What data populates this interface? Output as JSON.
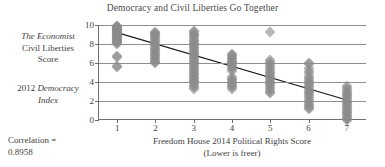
{
  "chart_data": {
    "type": "scatter",
    "title": "Democracy and Civil Liberties Go Together",
    "xlabel": "Freedom House 2014 Political Rights Score",
    "xlabel_sub": "(Lower is freer)",
    "ylabel_line1": "The Economist",
    "ylabel_line2": "Civil Liberties",
    "ylabel_line3": "Score",
    "ylabel2_line1_prefix": "2012 ",
    "ylabel2_line1_italic": "Democracy",
    "ylabel2_line2_italic": "Index",
    "correlation_label": "Correlation =",
    "correlation_value": "0.8958",
    "xlim": [
      0.5,
      7.5
    ],
    "ylim": [
      0,
      10
    ],
    "xticks": [
      1,
      2,
      3,
      4,
      5,
      6,
      7
    ],
    "yticks": [
      0,
      2,
      4,
      6,
      8,
      10
    ],
    "grid": "horizontal",
    "legend": "none",
    "marker": "diamond",
    "marker_color": "#8d8d8d",
    "trendline_color": "#1a1a1a",
    "trendline": {
      "x0": 1,
      "y0": 9.2,
      "x1": 7,
      "y1": 2.1
    },
    "points": [
      {
        "x": 1,
        "y": 9.93
      },
      {
        "x": 1,
        "y": 9.88
      },
      {
        "x": 1,
        "y": 9.8
      },
      {
        "x": 1,
        "y": 9.73
      },
      {
        "x": 1,
        "y": 9.65
      },
      {
        "x": 1,
        "y": 9.58
      },
      {
        "x": 1,
        "y": 9.5
      },
      {
        "x": 1,
        "y": 9.44
      },
      {
        "x": 1,
        "y": 9.38
      },
      {
        "x": 1,
        "y": 9.32
      },
      {
        "x": 1,
        "y": 9.26
      },
      {
        "x": 1,
        "y": 9.2
      },
      {
        "x": 1,
        "y": 9.12
      },
      {
        "x": 1,
        "y": 9.06
      },
      {
        "x": 1,
        "y": 9.0
      },
      {
        "x": 1,
        "y": 8.94
      },
      {
        "x": 1,
        "y": 8.88
      },
      {
        "x": 1,
        "y": 8.82
      },
      {
        "x": 1,
        "y": 8.76
      },
      {
        "x": 1,
        "y": 8.7
      },
      {
        "x": 1,
        "y": 8.62
      },
      {
        "x": 1,
        "y": 8.55
      },
      {
        "x": 1,
        "y": 8.48
      },
      {
        "x": 1,
        "y": 8.4
      },
      {
        "x": 1,
        "y": 8.32
      },
      {
        "x": 1,
        "y": 8.24
      },
      {
        "x": 1,
        "y": 8.16
      },
      {
        "x": 1,
        "y": 8.08
      },
      {
        "x": 1,
        "y": 8.0
      },
      {
        "x": 1,
        "y": 6.75
      },
      {
        "x": 1,
        "y": 6.65
      },
      {
        "x": 1,
        "y": 5.65
      },
      {
        "x": 1,
        "y": 5.55
      },
      {
        "x": 2,
        "y": 9.3
      },
      {
        "x": 2,
        "y": 9.2
      },
      {
        "x": 2,
        "y": 9.1
      },
      {
        "x": 2,
        "y": 8.95
      },
      {
        "x": 2,
        "y": 8.8
      },
      {
        "x": 2,
        "y": 8.65
      },
      {
        "x": 2,
        "y": 8.5
      },
      {
        "x": 2,
        "y": 8.35
      },
      {
        "x": 2,
        "y": 8.2
      },
      {
        "x": 2,
        "y": 8.05
      },
      {
        "x": 2,
        "y": 7.9
      },
      {
        "x": 2,
        "y": 7.75
      },
      {
        "x": 2,
        "y": 7.6
      },
      {
        "x": 2,
        "y": 7.45
      },
      {
        "x": 2,
        "y": 7.3
      },
      {
        "x": 2,
        "y": 7.15
      },
      {
        "x": 2,
        "y": 7.0
      },
      {
        "x": 2,
        "y": 6.85
      },
      {
        "x": 2,
        "y": 6.7
      },
      {
        "x": 2,
        "y": 6.55
      },
      {
        "x": 2,
        "y": 6.4
      },
      {
        "x": 2,
        "y": 6.25
      },
      {
        "x": 2,
        "y": 6.1
      },
      {
        "x": 2,
        "y": 6.0
      },
      {
        "x": 3,
        "y": 9.4
      },
      {
        "x": 3,
        "y": 9.25
      },
      {
        "x": 3,
        "y": 9.1
      },
      {
        "x": 3,
        "y": 8.95
      },
      {
        "x": 3,
        "y": 8.8
      },
      {
        "x": 3,
        "y": 8.62
      },
      {
        "x": 3,
        "y": 8.45
      },
      {
        "x": 3,
        "y": 8.3
      },
      {
        "x": 3,
        "y": 8.15
      },
      {
        "x": 3,
        "y": 8.0
      },
      {
        "x": 3,
        "y": 7.85
      },
      {
        "x": 3,
        "y": 7.7
      },
      {
        "x": 3,
        "y": 7.55
      },
      {
        "x": 3,
        "y": 7.4
      },
      {
        "x": 3,
        "y": 7.25
      },
      {
        "x": 3,
        "y": 7.1
      },
      {
        "x": 3,
        "y": 6.95
      },
      {
        "x": 3,
        "y": 6.8
      },
      {
        "x": 3,
        "y": 6.65
      },
      {
        "x": 3,
        "y": 6.5
      },
      {
        "x": 3,
        "y": 6.35
      },
      {
        "x": 3,
        "y": 6.2
      },
      {
        "x": 3,
        "y": 6.05
      },
      {
        "x": 3,
        "y": 5.9
      },
      {
        "x": 3,
        "y": 5.75
      },
      {
        "x": 3,
        "y": 5.6
      },
      {
        "x": 3,
        "y": 5.45
      },
      {
        "x": 3,
        "y": 5.3
      },
      {
        "x": 3,
        "y": 5.15
      },
      {
        "x": 3,
        "y": 5.0
      },
      {
        "x": 3,
        "y": 4.85
      },
      {
        "x": 3,
        "y": 4.7
      },
      {
        "x": 3,
        "y": 4.55
      },
      {
        "x": 3,
        "y": 4.4
      },
      {
        "x": 3,
        "y": 4.25
      },
      {
        "x": 3,
        "y": 4.1
      },
      {
        "x": 3,
        "y": 3.95
      },
      {
        "x": 3,
        "y": 3.8
      },
      {
        "x": 3,
        "y": 3.62
      },
      {
        "x": 3,
        "y": 3.45
      },
      {
        "x": 3,
        "y": 3.3
      },
      {
        "x": 4,
        "y": 7.0
      },
      {
        "x": 4,
        "y": 6.85
      },
      {
        "x": 4,
        "y": 6.7
      },
      {
        "x": 4,
        "y": 6.55
      },
      {
        "x": 4,
        "y": 6.4
      },
      {
        "x": 4,
        "y": 6.25
      },
      {
        "x": 4,
        "y": 6.1
      },
      {
        "x": 4,
        "y": 5.95
      },
      {
        "x": 4,
        "y": 5.8
      },
      {
        "x": 4,
        "y": 5.65
      },
      {
        "x": 4,
        "y": 5.5
      },
      {
        "x": 4,
        "y": 5.35
      },
      {
        "x": 4,
        "y": 5.2
      },
      {
        "x": 4,
        "y": 4.5
      },
      {
        "x": 4,
        "y": 4.35
      },
      {
        "x": 4,
        "y": 4.2
      },
      {
        "x": 4,
        "y": 4.05
      },
      {
        "x": 4,
        "y": 3.9
      },
      {
        "x": 4,
        "y": 3.75
      },
      {
        "x": 4,
        "y": 3.6
      },
      {
        "x": 4,
        "y": 3.45
      },
      {
        "x": 4,
        "y": 3.3
      },
      {
        "x": 5,
        "y": 9.25
      },
      {
        "x": 5,
        "y": 6.3
      },
      {
        "x": 5,
        "y": 6.1
      },
      {
        "x": 5,
        "y": 5.9
      },
      {
        "x": 5,
        "y": 5.7
      },
      {
        "x": 5,
        "y": 5.5
      },
      {
        "x": 5,
        "y": 5.3
      },
      {
        "x": 5,
        "y": 5.1
      },
      {
        "x": 5,
        "y": 4.9
      },
      {
        "x": 5,
        "y": 4.72
      },
      {
        "x": 5,
        "y": 4.55
      },
      {
        "x": 5,
        "y": 4.38
      },
      {
        "x": 5,
        "y": 4.2
      },
      {
        "x": 5,
        "y": 4.05
      },
      {
        "x": 5,
        "y": 3.9
      },
      {
        "x": 5,
        "y": 3.75
      },
      {
        "x": 5,
        "y": 3.6
      },
      {
        "x": 5,
        "y": 3.4
      },
      {
        "x": 5,
        "y": 3.2
      },
      {
        "x": 5,
        "y": 3.0
      },
      {
        "x": 5,
        "y": 2.85
      },
      {
        "x": 6,
        "y": 6.0
      },
      {
        "x": 6,
        "y": 5.85
      },
      {
        "x": 6,
        "y": 5.5
      },
      {
        "x": 6,
        "y": 5.2
      },
      {
        "x": 6,
        "y": 4.9
      },
      {
        "x": 6,
        "y": 4.6
      },
      {
        "x": 6,
        "y": 4.4
      },
      {
        "x": 6,
        "y": 4.2
      },
      {
        "x": 6,
        "y": 4.0
      },
      {
        "x": 6,
        "y": 3.85
      },
      {
        "x": 6,
        "y": 3.7
      },
      {
        "x": 6,
        "y": 3.55
      },
      {
        "x": 6,
        "y": 3.4
      },
      {
        "x": 6,
        "y": 3.2
      },
      {
        "x": 6,
        "y": 3.0
      },
      {
        "x": 6,
        "y": 2.8
      },
      {
        "x": 6,
        "y": 2.6
      },
      {
        "x": 6,
        "y": 2.4
      },
      {
        "x": 6,
        "y": 2.2
      },
      {
        "x": 6,
        "y": 2.0
      },
      {
        "x": 6,
        "y": 1.8
      },
      {
        "x": 6,
        "y": 1.6
      },
      {
        "x": 6,
        "y": 1.45
      },
      {
        "x": 6,
        "y": 1.3
      },
      {
        "x": 6,
        "y": 1.15
      },
      {
        "x": 7,
        "y": 3.6
      },
      {
        "x": 7,
        "y": 3.4
      },
      {
        "x": 7,
        "y": 3.2
      },
      {
        "x": 7,
        "y": 3.0
      },
      {
        "x": 7,
        "y": 2.82
      },
      {
        "x": 7,
        "y": 2.65
      },
      {
        "x": 7,
        "y": 2.5
      },
      {
        "x": 7,
        "y": 2.35
      },
      {
        "x": 7,
        "y": 2.2
      },
      {
        "x": 7,
        "y": 2.05
      },
      {
        "x": 7,
        "y": 1.9
      },
      {
        "x": 7,
        "y": 1.75
      },
      {
        "x": 7,
        "y": 1.6
      },
      {
        "x": 7,
        "y": 1.45
      },
      {
        "x": 7,
        "y": 1.3
      },
      {
        "x": 7,
        "y": 1.15
      },
      {
        "x": 7,
        "y": 1.0
      },
      {
        "x": 7,
        "y": 0.85
      },
      {
        "x": 7,
        "y": 0.7
      },
      {
        "x": 7,
        "y": 0.55
      },
      {
        "x": 7,
        "y": 0.4
      },
      {
        "x": 7,
        "y": 0.25
      },
      {
        "x": 7,
        "y": 0.12
      },
      {
        "x": 7,
        "y": 0.02
      }
    ]
  }
}
